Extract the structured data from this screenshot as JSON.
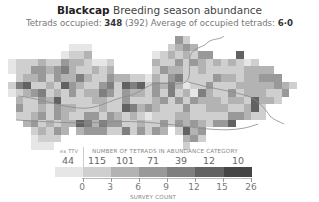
{
  "header": {
    "species": "Blackcap",
    "season": "Breeding season abundance",
    "tetrads_label": "Tetrads occupied:",
    "tetrads_value": "348",
    "tetrads_total": "(392)",
    "average_label": "Average of occupied tetrads:",
    "average_value": "6·0"
  },
  "legend": {
    "extv_label": "ex TTV",
    "extv_count": "44",
    "heading": "NUMBER OF TETRADS IN ABUNDANCE CATEGORY",
    "counts": [
      "115",
      "101",
      "71",
      "39",
      "12",
      "10"
    ],
    "ticks": [
      "0",
      "3",
      "6",
      "9",
      "12",
      "15",
      "26"
    ],
    "axis_title": "SURVEY COUNT",
    "colors": [
      "#e6e6e6",
      "#cfcfcf",
      "#b3b3b3",
      "#999999",
      "#7f7f7f",
      "#626262",
      "#454545"
    ]
  },
  "map": {
    "cell_size": 7.6,
    "river_color": "#8a8a8a",
    "rows": [
      "0000000000000000000000420000000000000000",
      "0000000011100000000002343000000000000000",
      "0000000122300000000123232440006000000000",
      "1222322433211200000322424323232120000000",
      "1224434532232300000243322322222333300000",
      "0233424335322433221324522224332334440000",
      "2562232643224526562435312242223333343200",
      "1234523242335424332425231532242333224000",
      "0322436222233224222342424333233263320000",
      "0422324332223226534322242233322362000000",
      "0223424322442432321222332222244322000000",
      "0034232336535442232242434324460000000000",
      "0002324303444225242430263400000000000000",
      "0001222000000000000000034200000000000000",
      "0001110000000000000000020000000000000000"
    ]
  }
}
